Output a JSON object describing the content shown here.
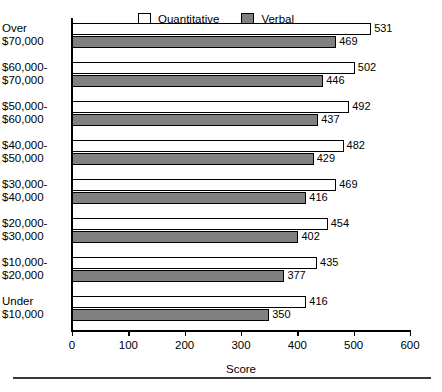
{
  "chart_data": {
    "type": "bar",
    "orientation": "horizontal",
    "title": "",
    "xlabel": "Score",
    "ylabel": "",
    "xlim": [
      0,
      600
    ],
    "xticks": [
      0,
      100,
      200,
      300,
      400,
      500,
      600
    ],
    "xticklabels": [
      "0",
      "100",
      "200",
      "300",
      "400",
      "500",
      "600"
    ],
    "grid": false,
    "legend_position": "top",
    "categories": [
      "Over $70,000",
      "$60,000-$70,000",
      "$50,000-$60,000",
      "$40,000-$50,000",
      "$30,000-$40,000",
      "$20,000-$30,000",
      "$10,000-$20,000",
      "Under $10,000"
    ],
    "category_lines": [
      [
        "Over",
        "$70,000"
      ],
      [
        "$60,000-",
        "$70,000"
      ],
      [
        "$50,000-",
        "$60,000"
      ],
      [
        "$40,000-",
        "$50,000"
      ],
      [
        "$30,000-",
        "$40,000"
      ],
      [
        "$20,000-",
        "$30,000"
      ],
      [
        "$10,000-",
        "$20,000"
      ],
      [
        "Under",
        "$10,000"
      ]
    ],
    "series": [
      {
        "name": "Quantitative",
        "color": "#ffffff",
        "values": [
          531,
          502,
          492,
          482,
          469,
          454,
          435,
          416
        ]
      },
      {
        "name": "Verbal",
        "color": "#808080",
        "values": [
          469,
          446,
          437,
          429,
          416,
          402,
          377,
          350
        ]
      }
    ]
  },
  "legend": {
    "items": [
      {
        "label": "Quantitative",
        "swatch": "white-square-icon"
      },
      {
        "label": "Verbal",
        "swatch": "gray-square-icon"
      }
    ]
  },
  "axis": {
    "xlabel": "Score"
  }
}
